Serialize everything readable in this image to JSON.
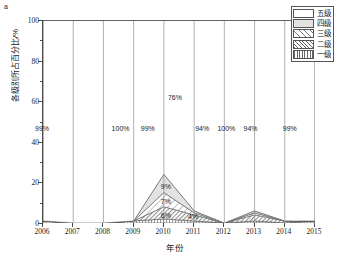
{
  "panel": {
    "label": "a"
  },
  "legend": {
    "items": [
      {
        "label": "五级",
        "pattern": "solid-white",
        "swatch_class": "sw-l5"
      },
      {
        "label": "四级",
        "pattern": "solid-light-gray",
        "swatch_class": "sw-l4"
      },
      {
        "label": "三级",
        "pattern": "sparse-diagonal",
        "swatch_class": "sw-l3"
      },
      {
        "label": "二级",
        "pattern": "dense-diagonal",
        "swatch_class": "sw-l2"
      },
      {
        "label": "一级",
        "pattern": "vertical-lines",
        "swatch_class": "sw-l1"
      }
    ]
  },
  "chart_data": {
    "type": "area",
    "title": "",
    "subtitle": "",
    "xlabel": "年份",
    "ylabel": "各级别所占百分比/%",
    "xlim": [
      2006,
      2015
    ],
    "ylim": [
      0,
      100
    ],
    "yticks": [
      0,
      20,
      40,
      60,
      80,
      100
    ],
    "ytick_labels": [
      "0",
      "20",
      "40",
      "60",
      "80",
      "100"
    ],
    "y_minor_ticks": [
      10,
      30,
      50,
      70,
      90
    ],
    "grid": false,
    "legend_position": "top-right",
    "stacked": true,
    "x": [
      2006,
      2007,
      2008,
      2009,
      2010,
      2011,
      2012,
      2013,
      2014,
      2015
    ],
    "categories": [
      "2006",
      "2007",
      "2008",
      "2009",
      "2010",
      "2011",
      "2012",
      "2013",
      "2014",
      "2015"
    ],
    "series": [
      {
        "name": "一级",
        "values": [
          1,
          0,
          0,
          1,
          2,
          1,
          0,
          1,
          0,
          1
        ]
      },
      {
        "name": "二级",
        "values": [
          0,
          0,
          0,
          0,
          6,
          3,
          0,
          3,
          1,
          0
        ]
      },
      {
        "name": "三级",
        "values": [
          0,
          0,
          0,
          0,
          7,
          1,
          0,
          1,
          0,
          0
        ]
      },
      {
        "name": "四级",
        "values": [
          0,
          0,
          0,
          0,
          9,
          1,
          0,
          1,
          0,
          0
        ]
      },
      {
        "name": "五级",
        "values": [
          99,
          100,
          100,
          99,
          76,
          94,
          100,
          94,
          99,
          99
        ]
      }
    ],
    "annotations": [
      {
        "text": "99%",
        "x": 2006.0,
        "y": 47
      },
      {
        "text": "100%",
        "x": 2008.6,
        "y": 47
      },
      {
        "text": "99%",
        "x": 2009.5,
        "y": 47
      },
      {
        "text": "76%",
        "x": 2010.4,
        "y": 62
      },
      {
        "text": "94%",
        "x": 2011.3,
        "y": 47
      },
      {
        "text": "100%",
        "x": 2012.1,
        "y": 47
      },
      {
        "text": "94%",
        "x": 2012.9,
        "y": 47
      },
      {
        "text": "99%",
        "x": 2014.2,
        "y": 47
      },
      {
        "text": "9%",
        "x": 2010.1,
        "y": 18
      },
      {
        "text": "7%",
        "x": 2010.1,
        "y": 11
      },
      {
        "text": "6%",
        "x": 2010.1,
        "y": 4
      },
      {
        "text": "4%",
        "x": 2011.0,
        "y": 3.5
      }
    ]
  },
  "colors": {
    "axis": "#4a4a4a",
    "band_edge": "#8f8f8f",
    "level5": "#ffffff",
    "level4": "#e2e2e2",
    "level3": "#ffffff",
    "level2": "#ffffff",
    "level1": "#ffffff",
    "text": "#1a1a1a"
  }
}
